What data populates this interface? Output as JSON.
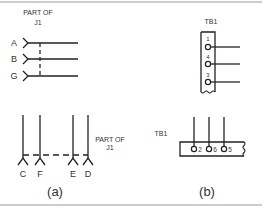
{
  "figure": {
    "panel_a": {
      "caption": "(a)",
      "top_connector": {
        "label_line1": "PART OF",
        "label_line2": "J1",
        "pins": [
          "A",
          "B",
          "G"
        ]
      },
      "bottom_connector": {
        "label_line1": "PART OF",
        "label_line2": "J1",
        "pins": [
          "C",
          "F",
          "E",
          "D"
        ]
      }
    },
    "panel_b": {
      "caption": "(b)",
      "top_terminal_board": {
        "label": "TB1",
        "terminals": [
          "1",
          "4",
          "3"
        ]
      },
      "bottom_terminal_board": {
        "label": "TB1",
        "terminals": [
          "2",
          "6",
          "5"
        ]
      }
    }
  },
  "colors": {
    "line": "#222222",
    "text": "#333333",
    "border": "#888888"
  }
}
